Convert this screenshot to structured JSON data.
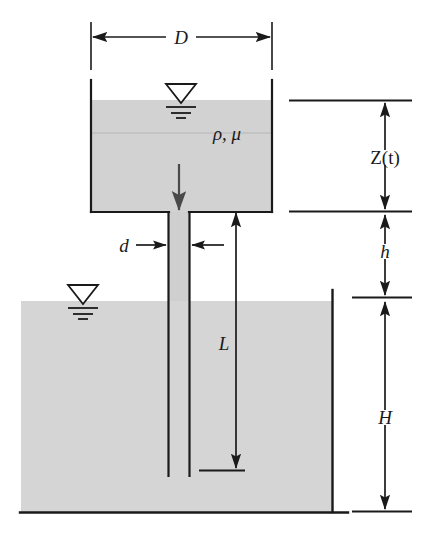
{
  "figure": {
    "background_color": "#ffffff",
    "line_color": "#1a1a1a",
    "fluid_fill_color": "#d2d2d2",
    "fluid_fill_color_lower": "#d5d5d5"
  },
  "labels": {
    "diameter_tank": "D",
    "diameter_pipe": "d",
    "fluid_properties": "ρ, μ",
    "height_variable": "Z(t)",
    "height_gap": "h",
    "pipe_length": "L",
    "reservoir_depth": "H"
  },
  "icons": {
    "free_surface_upper": "free-surface-symbol",
    "free_surface_lower": "free-surface-symbol",
    "flow_direction": "down-arrow"
  },
  "geometry": {
    "upper_tank": {
      "left_x": 91,
      "right_x": 272,
      "top_y": 80,
      "bottom_y": 212,
      "water_surface_y": 100
    },
    "pipe": {
      "left_x": 168,
      "right_x": 190,
      "top_y": 212,
      "bottom_y": 475
    },
    "reservoir": {
      "left_x": 21,
      "right_x": 333,
      "surface_y": 301,
      "bottom_y": 512
    },
    "dimensions": {
      "D": {
        "y": 37,
        "from_x": 91,
        "to_x": 272
      },
      "Z": {
        "x": 385,
        "from_y": 100,
        "to_y": 210
      },
      "h": {
        "x": 385,
        "from_y": 214,
        "to_y": 297
      },
      "H": {
        "x": 385,
        "from_y": 303,
        "to_y": 511
      },
      "L": {
        "x": 236,
        "from_y": 211,
        "to_y": 470
      },
      "d": {
        "y": 245,
        "label_x": 124
      }
    }
  }
}
